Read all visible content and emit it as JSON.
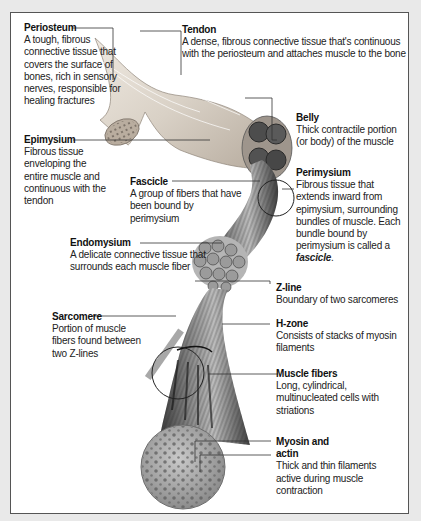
{
  "diagram": {
    "colors": {
      "page_bg": "#e9e9e9",
      "panel_bg": "#ffffff",
      "text": "#222222",
      "leader_line": "#333333",
      "sarcomere_bar": "#a8a8a8",
      "muscle_tone": "#6e6e6e"
    },
    "labels": {
      "periosteum": {
        "title": "Periosteum",
        "description": "A tough, fibrous connective tissue that covers the surface of bones, rich in sensory nerves, responsible for healing fractures"
      },
      "tendon": {
        "title": "Tendon",
        "description": "A dense, fibrous connective tissue that's continuous with the periosteum and attaches muscle to the bone"
      },
      "belly": {
        "title": "Belly",
        "description": "Thick contractile portion (or body) of the muscle"
      },
      "epimysium": {
        "title": "Epimysium",
        "description": "Fibrous tissue enveloping the entire muscle and continuous with the tendon"
      },
      "fascicle": {
        "title": "Fascicle",
        "description": "A group of fibers that have been bound by perimysium"
      },
      "perimysium": {
        "title": "Perimysium",
        "description": "Fibrous tissue that extends inward from epimysium, surrounding bundles of muscle. Each bundle bound by perimysium is called a",
        "emphasis": "fascicle",
        "tail": "."
      },
      "endomysium": {
        "title": "Endomysium",
        "description": "A delicate connective tissue that surrounds each muscle fiber"
      },
      "zline": {
        "title": "Z-line",
        "description": "Boundary of two sarcomeres"
      },
      "sarcomere": {
        "title": "Sarcomere",
        "description": "Portion of muscle fibers found between two Z-lines"
      },
      "hzone": {
        "title": "H-zone",
        "description": "Consists of stacks of myosin filaments"
      },
      "muscle_fibers": {
        "title": "Muscle fibers",
        "description": "Long, cylindrical, multinucleated cells with striations"
      },
      "myosin_actin": {
        "title_line1": "Myosin and",
        "title_line2": "actin",
        "description": "Thick and thin filaments active during muscle contraction"
      }
    }
  }
}
